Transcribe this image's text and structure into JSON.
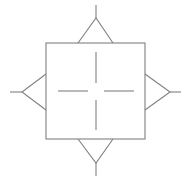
{
  "diagram": {
    "canvas": {
      "width": 191,
      "height": 180,
      "background": "#ffffff"
    },
    "stroke": {
      "color": "#808080",
      "width": 1.1
    },
    "shapes": [
      {
        "name": "center-square",
        "kind": "rect",
        "x": 46,
        "y": 43,
        "width": 99,
        "height": 96
      },
      {
        "name": "top-triangle",
        "kind": "polyline",
        "direction": "up",
        "points": "78,43 96,18 113,43"
      },
      {
        "name": "top-stem",
        "kind": "line",
        "x1": 96,
        "y1": 18,
        "x2": 96,
        "y2": 5
      },
      {
        "name": "bottom-triangle",
        "kind": "polyline",
        "direction": "down",
        "points": "78,139 96,163 113,139"
      },
      {
        "name": "bottom-stem",
        "kind": "line",
        "x1": 96,
        "y1": 163,
        "x2": 96,
        "y2": 176
      },
      {
        "name": "left-triangle",
        "kind": "polyline",
        "direction": "left",
        "points": "46,74 22,92 46,110"
      },
      {
        "name": "left-stem",
        "kind": "line",
        "x1": 22,
        "y1": 92,
        "x2": 10,
        "y2": 92
      },
      {
        "name": "right-triangle",
        "kind": "polyline",
        "direction": "right",
        "points": "145,74 170,92 145,110"
      },
      {
        "name": "right-stem",
        "kind": "line",
        "x1": 170,
        "y1": 92,
        "x2": 181,
        "y2": 92
      },
      {
        "name": "center-crosshair-up",
        "kind": "line",
        "x1": 96,
        "y1": 52,
        "x2": 96,
        "y2": 83
      },
      {
        "name": "center-crosshair-down",
        "kind": "line",
        "x1": 96,
        "y1": 100,
        "x2": 96,
        "y2": 130
      },
      {
        "name": "center-crosshair-left",
        "kind": "line",
        "x1": 58,
        "y1": 91,
        "x2": 88,
        "y2": 91
      },
      {
        "name": "center-crosshair-right",
        "kind": "line",
        "x1": 104,
        "y1": 91,
        "x2": 134,
        "y2": 91
      }
    ]
  }
}
